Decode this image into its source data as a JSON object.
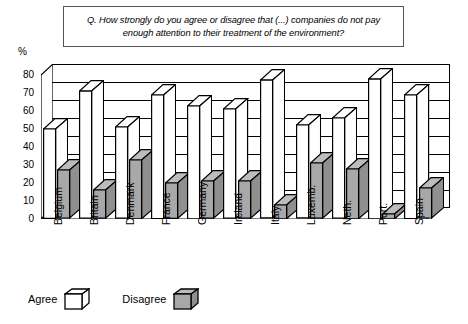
{
  "title": {
    "text": "Q. How strongly do you agree or disagree that (...) companies do not pay enough attention to their treatment of the environment?"
  },
  "axis": {
    "y_unit_label": "%",
    "y_ticks": [
      "0",
      "10",
      "20",
      "30",
      "40",
      "50",
      "60",
      "70",
      "80"
    ]
  },
  "legend": {
    "agree_label": "Agree",
    "disagree_label": "Disagree"
  },
  "colors": {
    "agree_fill": "#ffffff",
    "disagree_fill": "#a8a8a8",
    "outline": "#000000",
    "title_border": "#555555"
  },
  "chart_data": {
    "type": "bar",
    "title": "Q. How strongly do you agree or disagree that (...) companies do not pay enough attention to their treatment of the environment?",
    "xlabel": "",
    "ylabel": "%",
    "ylim": [
      0,
      80
    ],
    "yticks": [
      0,
      10,
      20,
      30,
      40,
      50,
      60,
      70,
      80
    ],
    "grid": true,
    "legend_position": "bottom-left",
    "categories": [
      "Belgium",
      "Britain",
      "Denmark",
      "France",
      "Germany",
      "Ireland",
      "Italy",
      "Luxemb.",
      "Neth.",
      "Port.",
      "Spain"
    ],
    "series": [
      {
        "name": "Agree",
        "values": [
          50,
          71,
          51,
          69,
          63,
          61,
          77,
          52,
          56,
          78,
          69
        ]
      },
      {
        "name": "Disagree",
        "values": [
          27,
          16,
          33,
          20,
          21,
          21,
          8,
          31,
          28,
          3,
          17
        ]
      }
    ]
  }
}
